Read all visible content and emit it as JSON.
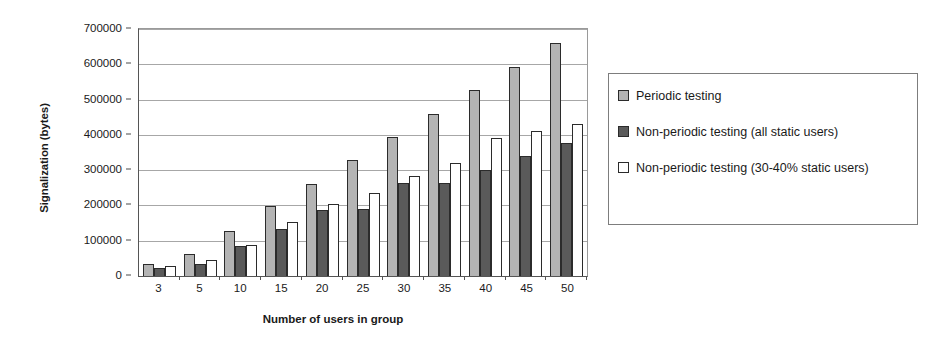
{
  "chart_data": {
    "type": "bar",
    "title": "",
    "xlabel": "Number of users in group",
    "ylabel": "Signalization (bytes)",
    "categories": [
      "3",
      "5",
      "10",
      "15",
      "20",
      "25",
      "30",
      "35",
      "40",
      "45",
      "50"
    ],
    "series": [
      {
        "name": "Periodic testing",
        "color": "#b4b4b4",
        "values": [
          35000,
          63000,
          128000,
          198000,
          262000,
          329000,
          393000,
          459000,
          527000,
          593000,
          660000
        ]
      },
      {
        "name": "Non-periodic testing (all static users)",
        "color": "#5a5a5a",
        "values": [
          24000,
          34000,
          84000,
          133000,
          186000,
          190000,
          263000,
          263000,
          300000,
          341000,
          377000
        ]
      },
      {
        "name": "Non-periodic testing (30-40% static users)",
        "color": "#ffffff",
        "values": [
          28000,
          44000,
          89000,
          152000,
          204000,
          235000,
          284000,
          321000,
          391000,
          410000,
          431000
        ]
      }
    ],
    "ylim": [
      0,
      700000
    ],
    "ytick_values": [
      0,
      100000,
      200000,
      300000,
      400000,
      500000,
      600000,
      700000
    ],
    "ytick_labels": [
      "0",
      "100000",
      "200000",
      "300000",
      "400000",
      "500000",
      "600000",
      "700000"
    ],
    "grid": true,
    "legend_position": "right",
    "legend_entries": [
      "Periodic testing",
      "Non-periodic testing (all static users)",
      "Non-periodic testing (30-40% static users)"
    ]
  }
}
